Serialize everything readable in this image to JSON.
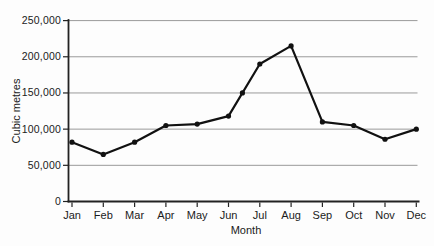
{
  "chart_data": {
    "type": "line",
    "title": "",
    "xlabel": "Month",
    "ylabel": "Cubic metres",
    "categories": [
      "Jan",
      "Feb",
      "Mar",
      "Apr",
      "May",
      "Jun",
      "Jul",
      "Aug",
      "Sep",
      "Oct",
      "Nov",
      "Dec"
    ],
    "series": [
      {
        "name": "Cubic metres",
        "values": [
          82000,
          65000,
          82000,
          105000,
          107000,
          118000,
          190000,
          215000,
          110000,
          105000,
          86000,
          100000
        ]
      }
    ],
    "extra_marker": {
      "note": "additional marker drawn where the Jun-Jul segment crosses the 150,000 gridline",
      "between": [
        "Jun",
        "Jul"
      ],
      "value": 150000
    },
    "ylim": [
      0,
      250000
    ],
    "ytick_step": 50000,
    "ytick_labels": [
      "0",
      "50,000",
      "100,000",
      "150,000",
      "200,000",
      "250,000"
    ],
    "grid": "horizontal",
    "legend": "none",
    "marker": "filled-circle",
    "colors": {
      "line": "#111111",
      "marker": "#111111",
      "grid": "#9a9a9a",
      "axis": "#222222",
      "text": "#1b1b1b",
      "background": "#fdfdfd"
    }
  }
}
